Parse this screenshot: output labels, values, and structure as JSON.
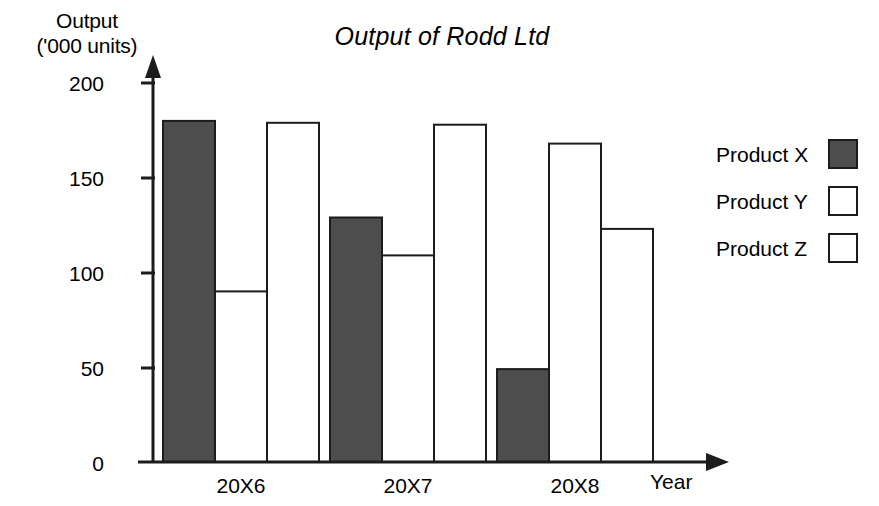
{
  "chart_data": {
    "type": "bar",
    "title": "Output of Rodd Ltd",
    "xlabel": "Year",
    "ylabel": "Output ('000 units)",
    "ylabel_line1": "Output",
    "ylabel_line2": "('000 units)",
    "categories": [
      "20X6",
      "20X7",
      "20X8"
    ],
    "series": [
      {
        "name": "Product X",
        "values": [
          180,
          129,
          49
        ],
        "fill": "#4d4d4d",
        "stroke": "#1c1c1c"
      },
      {
        "name": "Product Y",
        "values": [
          90,
          109,
          168
        ],
        "fill": "#ffffff",
        "stroke": "#1c1c1c"
      },
      {
        "name": "Product Z",
        "values": [
          179,
          178,
          123
        ],
        "fill": "#ffffff",
        "stroke": "#1c1c1c"
      }
    ],
    "ylim": [
      0,
      200
    ],
    "yticks": [
      0,
      50,
      100,
      150,
      200
    ],
    "ytick_labels": [
      "0",
      "50",
      "100",
      "150",
      "200"
    ],
    "grid": false,
    "legend_position": "right",
    "axis_style": "arrow-ended",
    "axis_color": "#1c1c1c",
    "background": "#ffffff"
  },
  "legend": {
    "entries": [
      {
        "label": "Product X",
        "swatch": "filled"
      },
      {
        "label": "Product Y",
        "swatch": "empty"
      },
      {
        "label": "Product Z",
        "swatch": "empty"
      }
    ]
  },
  "yticks": {
    "t200": "200",
    "t150": "150",
    "t100": "100",
    "t50": "50",
    "t0": "0"
  },
  "xticks": {
    "c0": "20X6",
    "c1": "20X7",
    "c2": "20X8"
  }
}
